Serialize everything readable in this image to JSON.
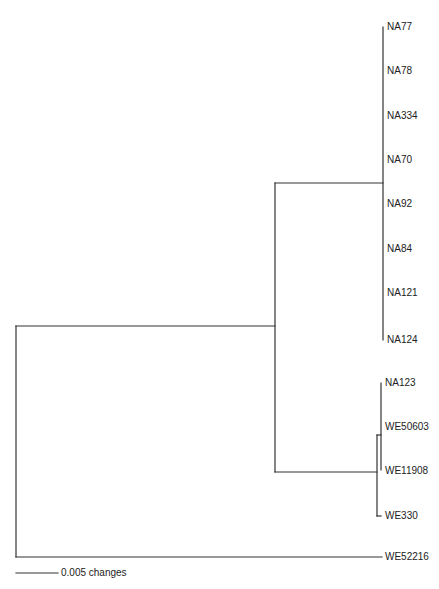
{
  "diagram": {
    "type": "phylogenetic-tree",
    "line_color": "#333333",
    "taxa": [
      {
        "name": "NA77",
        "y": 27
      },
      {
        "name": "NA78",
        "y": 71
      },
      {
        "name": "NA334",
        "y": 116
      },
      {
        "name": "NA70",
        "y": 160
      },
      {
        "name": "NA92",
        "y": 204
      },
      {
        "name": "NA84",
        "y": 249
      },
      {
        "name": "NA121",
        "y": 293
      },
      {
        "name": "NA124",
        "y": 340
      },
      {
        "name": "NA123",
        "y": 383
      },
      {
        "name": "WE50603",
        "y": 427
      },
      {
        "name": "WE11908",
        "y": 470
      },
      {
        "name": "WE330",
        "y": 516
      },
      {
        "name": "WE52216",
        "y": 557
      }
    ],
    "scale_bar": {
      "label": "0.005 changes",
      "value": 0.005
    }
  }
}
